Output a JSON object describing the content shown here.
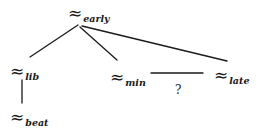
{
  "diagram": {
    "type": "tree",
    "symbol": "≈",
    "nodes": {
      "early": {
        "symbol": "≈",
        "subscript": "early"
      },
      "lib": {
        "symbol": "≈",
        "subscript": "lib"
      },
      "beat": {
        "symbol": "≈",
        "subscript": "beat"
      },
      "min": {
        "symbol": "≈",
        "subscript": "min"
      },
      "late": {
        "symbol": "≈",
        "subscript": "late"
      }
    },
    "edges": [
      {
        "from": "early",
        "to": "lib"
      },
      {
        "from": "early",
        "to": "min"
      },
      {
        "from": "early",
        "to": "late"
      },
      {
        "from": "lib",
        "to": "beat"
      },
      {
        "from": "min",
        "to": "late",
        "label": "?"
      }
    ],
    "unknown_relation_label": "?"
  },
  "colors": {
    "ink": "#1a1a1a",
    "background": "#ffffff"
  }
}
